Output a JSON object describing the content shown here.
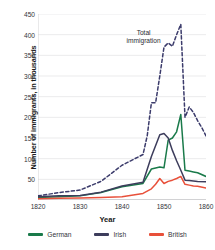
{
  "chart_data": {
    "type": "line",
    "title": "",
    "xlabel": "Year",
    "ylabel": "Number of immigrants, in thousands",
    "xlim": [
      1820,
      1860
    ],
    "ylim": [
      0,
      450
    ],
    "xticks": [
      1820,
      1830,
      1840,
      1850,
      1860
    ],
    "yticks": [
      50,
      100,
      150,
      200,
      250,
      300,
      350,
      400,
      450
    ],
    "grid": true,
    "legend_position": "bottom",
    "annotations": [
      {
        "text": "Total\nimmigration",
        "x": 1848,
        "y": 400
      }
    ],
    "series": [
      {
        "name": "Total immigration",
        "style": "dashed",
        "color": "#3b3b6b",
        "in_legend": false,
        "x": [
          1820,
          1825,
          1830,
          1835,
          1840,
          1845,
          1846,
          1847,
          1848,
          1849,
          1850,
          1851,
          1852,
          1853,
          1854,
          1855,
          1856,
          1857,
          1858,
          1859,
          1860
        ],
        "values": [
          10,
          18,
          24,
          45,
          84,
          110,
          155,
          235,
          235,
          300,
          370,
          380,
          372,
          400,
          425,
          200,
          225,
          212,
          192,
          175,
          155
        ]
      },
      {
        "name": "German",
        "style": "solid",
        "color": "#1a7a4a",
        "in_legend": true,
        "x": [
          1820,
          1825,
          1830,
          1835,
          1840,
          1845,
          1847,
          1849,
          1850,
          1851,
          1852,
          1853,
          1854,
          1855,
          1856,
          1857,
          1858,
          1860
        ],
        "values": [
          6,
          8,
          10,
          18,
          32,
          40,
          75,
          80,
          78,
          145,
          150,
          165,
          207,
          72,
          70,
          68,
          66,
          57
        ]
      },
      {
        "name": "Irish",
        "style": "solid",
        "color": "#3d3d5c",
        "in_legend": true,
        "x": [
          1820,
          1825,
          1830,
          1835,
          1840,
          1845,
          1847,
          1849,
          1850,
          1851,
          1852,
          1853,
          1854,
          1855,
          1856,
          1857,
          1858,
          1860
        ],
        "values": [
          8,
          10,
          11,
          19,
          34,
          43,
          105,
          158,
          161,
          150,
          120,
          95,
          72,
          48,
          47,
          46,
          45,
          44
        ]
      },
      {
        "name": "British",
        "style": "solid",
        "color": "#e8503a",
        "in_legend": true,
        "x": [
          1820,
          1825,
          1830,
          1835,
          1840,
          1845,
          1847,
          1848,
          1849,
          1850,
          1851,
          1852,
          1853,
          1854,
          1855,
          1856,
          1857,
          1858,
          1860
        ],
        "values": [
          3,
          4,
          5,
          6,
          8,
          16,
          27,
          38,
          52,
          40,
          45,
          48,
          52,
          57,
          38,
          36,
          34,
          33,
          29
        ]
      }
    ]
  },
  "legend": [
    {
      "label": "German",
      "color": "#1a7a4a"
    },
    {
      "label": "Irish",
      "color": "#3d3d5c"
    },
    {
      "label": "British",
      "color": "#e8503a"
    }
  ]
}
